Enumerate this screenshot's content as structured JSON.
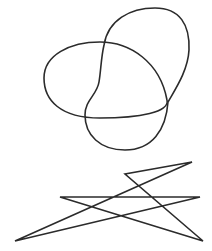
{
  "canvas": {
    "width": 212,
    "height": 251,
    "background": "#ffffff"
  },
  "stroke_color": "#2b2b2b",
  "shapes": [
    {
      "name": "ellipse-loop",
      "type": "closed-curve",
      "path": "M 44 78 C 44 55, 70 42, 100 42 C 130 42, 160 62, 167 100 C 170 112, 140 118, 100 118 C 60 118, 44 100, 44 78 Z"
    },
    {
      "name": "bean-loop",
      "type": "closed-curve",
      "path": "M 104 45 C 108 20, 130 8, 155 8 C 180 8, 190 25, 189 50 C 188 70, 176 88, 168 102 C 166 130, 152 150, 125 150 C 100 150, 85 135, 85 115 C 85 100, 97 95, 99 82 C 101 70, 101 58, 104 45 Z"
    },
    {
      "name": "zigzag-polyline",
      "type": "closed-polygon",
      "points": "192,162 125,174 203,241 60,197 200,197 15,241 192,162"
    }
  ]
}
